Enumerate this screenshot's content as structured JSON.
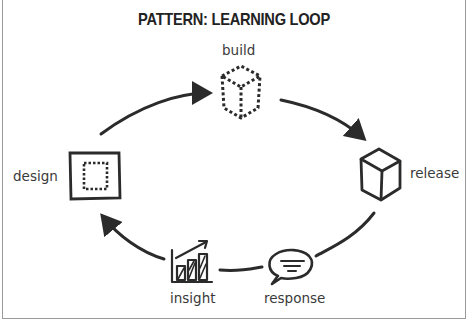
{
  "title": "PATTERN: LEARNING LOOP",
  "nodes": [
    {
      "id": "build",
      "label": "build",
      "icon": "dashed-cube-icon"
    },
    {
      "id": "release",
      "label": "release",
      "icon": "cube-icon"
    },
    {
      "id": "response",
      "label": "response",
      "icon": "speech-bubble-icon"
    },
    {
      "id": "insight",
      "label": "insight",
      "icon": "bar-chart-trend-icon"
    },
    {
      "id": "design",
      "label": "design",
      "icon": "square-with-dashed-inner-square-icon"
    }
  ],
  "edges": [
    {
      "from": "design",
      "to": "build"
    },
    {
      "from": "build",
      "to": "release"
    },
    {
      "from": "release",
      "to": "response"
    },
    {
      "from": "response",
      "to": "insight"
    },
    {
      "from": "insight",
      "to": "design"
    }
  ],
  "colors": {
    "stroke": "#2b2b2b",
    "text": "#3a3a3a",
    "border": "#9a9a9a"
  }
}
